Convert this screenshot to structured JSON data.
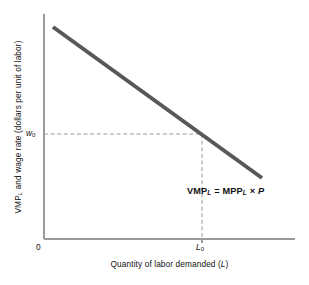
{
  "chart_data": {
    "type": "line",
    "title": "",
    "xlabel": "Quantity of labor demanded (L)",
    "ylabel": "VMP_L and wage rate (dollars per unit of labor)",
    "xlabel_main": "Quantity of labor demanded (",
    "xlabel_var": "L",
    "xlabel_tail": ")",
    "ylabel_head": "VMP",
    "ylabel_sub": "L",
    "ylabel_tail": " and wage rate (dollars per unit of labor)",
    "origin_label": "0",
    "grid": false,
    "legend": "none",
    "xlim": [
      0,
      1
    ],
    "ylim": [
      0,
      1
    ],
    "series": [
      {
        "name": "VMP_L = MPP_L × P",
        "kind": "line",
        "color": "#585858",
        "linewidth": 4,
        "points": [
          {
            "x_px": 53,
            "y_px": 27
          },
          {
            "x_px": 262,
            "y_px": 178
          }
        ]
      }
    ],
    "tick_labels": {
      "y": [
        {
          "text": "w0",
          "base": "w",
          "sub": "0",
          "y_px": 134
        }
      ],
      "x": [
        {
          "text": "L0",
          "base": "L",
          "sub": "0",
          "x_px": 202
        }
      ]
    },
    "guides": [
      {
        "name": "wage-guide-horizontal",
        "style": "dashed",
        "color": "#9a9a9a",
        "from_px": [
          44,
          134
        ],
        "to_px": [
          202,
          134
        ]
      },
      {
        "name": "labor-guide-vertical",
        "style": "dashed",
        "color": "#9a9a9a",
        "from_px": [
          202,
          134
        ],
        "to_px": [
          202,
          239
        ]
      }
    ],
    "annotations": [
      {
        "name": "vmp-equation",
        "text": "VMP_L = MPP_L × P",
        "parts": {
          "a": "VMP",
          "a_sub": "L",
          "eq": " = ",
          "b": "MPP",
          "b_sub": "L",
          "times": " × ",
          "p": "P"
        },
        "x_px": 187,
        "y_px": 187,
        "bold": true
      }
    ],
    "axes": {
      "color": "#9a9a9a",
      "y_axis_px": {
        "x": 44,
        "y_top": 14,
        "y_bottom": 239
      },
      "x_axis_px": {
        "y": 239,
        "x_left": 44,
        "x_right": 295
      }
    },
    "colors": {
      "background": "#ffffff",
      "curve": "#585858",
      "axis": "#9a9a9a",
      "guide": "#9a9a9a",
      "text": "#111111"
    }
  }
}
